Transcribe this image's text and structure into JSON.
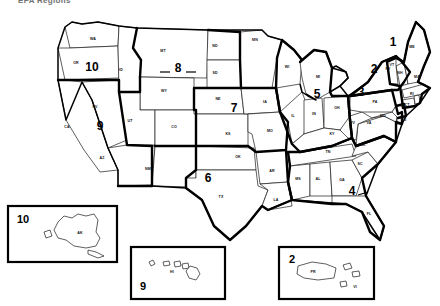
{
  "header": {
    "title": "EPA Regions"
  },
  "map": {
    "title": "United States EPA Regions Map",
    "background_color": "#ffffff",
    "line_color": "#000000",
    "region_boundary_color": "#000000",
    "state_label_color": "#111111"
  },
  "regions": [
    {
      "number": "1",
      "x": 393,
      "y": 46,
      "states": [
        "ME",
        "VT",
        "NH",
        "MA",
        "RI",
        "CT"
      ]
    },
    {
      "number": "2",
      "x": 374,
      "y": 73,
      "states": [
        "NY",
        "NJ"
      ]
    },
    {
      "number": "3",
      "x": 361,
      "y": 96,
      "states": [
        "PA",
        "WV",
        "VA",
        "MD",
        "DE"
      ]
    },
    {
      "number": "4",
      "x": 352,
      "y": 195,
      "states": [
        "KY",
        "TN",
        "NC",
        "SC",
        "GA",
        "AL",
        "MS",
        "FL"
      ]
    },
    {
      "number": "5",
      "x": 317,
      "y": 98,
      "states": [
        "MN",
        "WI",
        "MI",
        "IL",
        "IN",
        "OH"
      ]
    },
    {
      "number": "6",
      "x": 208,
      "y": 182,
      "states": [
        "NM",
        "TX",
        "OK",
        "AR",
        "LA"
      ]
    },
    {
      "number": "7",
      "x": 234,
      "y": 112,
      "states": [
        "NE",
        "KS",
        "IA",
        "MO"
      ]
    },
    {
      "number": "8",
      "x": 178,
      "y": 72,
      "states": [
        "MT",
        "ND",
        "SD",
        "WY",
        "UT",
        "CO"
      ]
    },
    {
      "number": "9",
      "x": 100,
      "y": 130,
      "states": [
        "CA",
        "NV",
        "AZ",
        "HI"
      ]
    },
    {
      "number": "10",
      "x": 92,
      "y": 71,
      "states": [
        "WA",
        "OR",
        "ID",
        "AK"
      ]
    }
  ],
  "state_labels": [
    {
      "abbr": "WA",
      "x": 93,
      "y": 40
    },
    {
      "abbr": "OR",
      "x": 76,
      "y": 64
    },
    {
      "abbr": "ID",
      "x": 121,
      "y": 71
    },
    {
      "abbr": "MT",
      "x": 163,
      "y": 52
    },
    {
      "abbr": "ND",
      "x": 215,
      "y": 47
    },
    {
      "abbr": "SD",
      "x": 215,
      "y": 74
    },
    {
      "abbr": "WY",
      "x": 164,
      "y": 92
    },
    {
      "abbr": "NV",
      "x": 95,
      "y": 108
    },
    {
      "abbr": "CA",
      "x": 67,
      "y": 128
    },
    {
      "abbr": "UT",
      "x": 130,
      "y": 122
    },
    {
      "abbr": "CO",
      "x": 174,
      "y": 128
    },
    {
      "abbr": "AZ",
      "x": 102,
      "y": 159
    },
    {
      "abbr": "NM",
      "x": 148,
      "y": 170
    },
    {
      "abbr": "NE",
      "x": 218,
      "y": 100
    },
    {
      "abbr": "KS",
      "x": 228,
      "y": 135
    },
    {
      "abbr": "OK",
      "x": 238,
      "y": 158
    },
    {
      "abbr": "TX",
      "x": 221,
      "y": 198
    },
    {
      "abbr": "MN",
      "x": 255,
      "y": 41
    },
    {
      "abbr": "IA",
      "x": 265,
      "y": 103
    },
    {
      "abbr": "MO",
      "x": 270,
      "y": 132
    },
    {
      "abbr": "AR",
      "x": 272,
      "y": 172
    },
    {
      "abbr": "LA",
      "x": 276,
      "y": 201
    },
    {
      "abbr": "WI",
      "x": 287,
      "y": 68
    },
    {
      "abbr": "IL",
      "x": 293,
      "y": 117
    },
    {
      "abbr": "MI",
      "x": 318,
      "y": 78
    },
    {
      "abbr": "IN",
      "x": 314,
      "y": 115
    },
    {
      "abbr": "OH",
      "x": 337,
      "y": 109
    },
    {
      "abbr": "KY",
      "x": 332,
      "y": 135
    },
    {
      "abbr": "TN",
      "x": 328,
      "y": 153
    },
    {
      "abbr": "MS",
      "x": 298,
      "y": 180
    },
    {
      "abbr": "AL",
      "x": 318,
      "y": 180
    },
    {
      "abbr": "GA",
      "x": 342,
      "y": 181
    },
    {
      "abbr": "FL",
      "x": 369,
      "y": 215
    },
    {
      "abbr": "SC",
      "x": 360,
      "y": 165
    },
    {
      "abbr": "NC",
      "x": 363,
      "y": 146
    },
    {
      "abbr": "VA",
      "x": 369,
      "y": 124
    },
    {
      "abbr": "WV",
      "x": 352,
      "y": 124
    },
    {
      "abbr": "MD",
      "x": 383,
      "y": 117
    },
    {
      "abbr": "DE",
      "x": 404,
      "y": 121
    },
    {
      "abbr": "PA",
      "x": 375,
      "y": 103
    },
    {
      "abbr": "NJ",
      "x": 403,
      "y": 107
    },
    {
      "abbr": "NY",
      "x": 388,
      "y": 70
    },
    {
      "abbr": "CT",
      "x": 407,
      "y": 106
    },
    {
      "abbr": "RI",
      "x": 412,
      "y": 95
    },
    {
      "abbr": "MA",
      "x": 417,
      "y": 78
    },
    {
      "abbr": "NH",
      "x": 400,
      "y": 74
    },
    {
      "abbr": "VT",
      "x": 392,
      "y": 66
    },
    {
      "abbr": "ME",
      "x": 412,
      "y": 48
    }
  ],
  "insets": [
    {
      "name": "alaska-inset",
      "region_number": "10",
      "state_abbr": "AK",
      "box": {
        "x": 8,
        "y": 206,
        "w": 109,
        "h": 56
      }
    },
    {
      "name": "hawaii-inset",
      "region_number": "9",
      "state_abbr": "HI",
      "box": {
        "x": 131,
        "y": 247,
        "w": 94,
        "h": 52
      }
    },
    {
      "name": "puerto-rico-inset",
      "region_number": "2",
      "state_abbr": "PR",
      "secondary_abbr": "VI",
      "box": {
        "x": 279,
        "y": 247,
        "w": 95,
        "h": 52
      }
    }
  ]
}
